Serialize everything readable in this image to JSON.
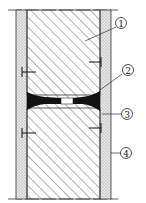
{
  "diagram": {
    "type": "wall-joint-section",
    "callouts": [
      {
        "id": "1",
        "label": "1"
      },
      {
        "id": "2",
        "label": "2"
      },
      {
        "id": "3",
        "label": "3"
      },
      {
        "id": "4",
        "label": "4"
      }
    ],
    "colors": {
      "line": "#222222",
      "stipple": "#dcdcdc",
      "fill": "#111111",
      "background": "#ffffff"
    }
  }
}
